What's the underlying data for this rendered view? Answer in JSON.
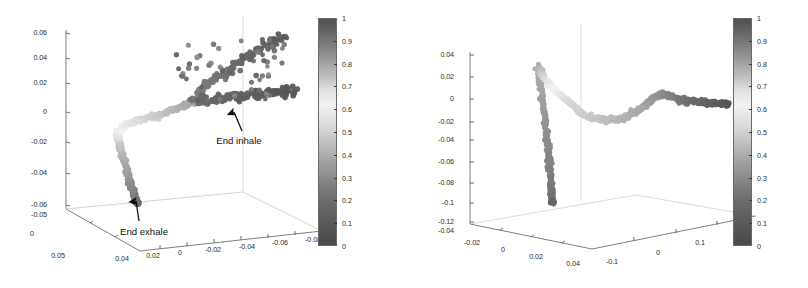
{
  "figure": {
    "background": "#ffffff",
    "panel_count": 2
  },
  "chart_data": [
    {
      "type": "scatter",
      "title": "",
      "subtitle": "",
      "projection": "3d",
      "panel": "left",
      "xlabel": "",
      "ylabel": "",
      "zlabel": "",
      "grid": false,
      "legend": null,
      "colormap": "grayscale-jet",
      "colorbar": {
        "min": 0,
        "max": 1,
        "ticks": [
          "1",
          "0.9",
          "0.8",
          "0.7",
          "0.6",
          "0.5",
          "0.4",
          "0.3",
          "0.2",
          "0.1",
          "0"
        ],
        "orientation": "vertical",
        "position": "right"
      },
      "axes": {
        "vertical_axis_ticks": [
          "0.06",
          "0.04",
          "0.02",
          "0",
          "-0.02",
          "-0.04",
          "-0.06"
        ],
        "vertical_axis_range": [
          -0.06,
          0.06
        ],
        "depth_axis_ticks": [
          "-0.05",
          "0",
          "0.05"
        ],
        "depth_axis_range": [
          -0.05,
          0.05
        ],
        "horizontal_axis_ticks": [
          "0.04",
          "0.02",
          "0",
          "-0.02",
          "-0.04",
          "-0.06",
          "-0.08"
        ],
        "horizontal_axis_range": [
          0.04,
          -0.08
        ]
      },
      "annotations": [
        {
          "text": "End inhale",
          "arrow": "up",
          "target": "upper-right dark cluster"
        },
        {
          "text": "End exhale",
          "arrow": "up",
          "target": "lower-left dark branch"
        }
      ],
      "points": [
        [
          0.163,
          0.131,
          0.93
        ],
        [
          0.176,
          0.138,
          0.93
        ],
        [
          0.169,
          0.15,
          0.92
        ],
        [
          0.182,
          0.147,
          0.92
        ],
        [
          0.195,
          0.16,
          0.91
        ],
        [
          0.189,
          0.172,
          0.9
        ],
        [
          0.203,
          0.168,
          0.9
        ],
        [
          0.211,
          0.18,
          0.89
        ],
        [
          0.206,
          0.192,
          0.88
        ],
        [
          0.219,
          0.188,
          0.88
        ],
        [
          0.228,
          0.2,
          0.87
        ],
        [
          0.222,
          0.212,
          0.86
        ],
        [
          0.235,
          0.208,
          0.86
        ],
        [
          0.243,
          0.22,
          0.85
        ],
        [
          0.238,
          0.232,
          0.84
        ],
        [
          0.251,
          0.228,
          0.84
        ],
        [
          0.259,
          0.24,
          0.83
        ],
        [
          0.253,
          0.252,
          0.82
        ],
        [
          0.266,
          0.248,
          0.82
        ],
        [
          0.274,
          0.26,
          0.81
        ],
        [
          0.269,
          0.272,
          0.8
        ],
        [
          0.282,
          0.268,
          0.8
        ],
        [
          0.29,
          0.281,
          0.79
        ],
        [
          0.285,
          0.292,
          0.78
        ],
        [
          0.298,
          0.29,
          0.78
        ],
        [
          0.306,
          0.302,
          0.77
        ],
        [
          0.3,
          0.313,
          0.76
        ],
        [
          0.314,
          0.31,
          0.76
        ],
        [
          0.322,
          0.323,
          0.75
        ],
        [
          0.316,
          0.334,
          0.74
        ],
        [
          0.33,
          0.331,
          0.73
        ],
        [
          0.337,
          0.343,
          0.72
        ],
        [
          0.332,
          0.355,
          0.71
        ],
        [
          0.345,
          0.352,
          0.7
        ],
        [
          0.353,
          0.364,
          0.69
        ],
        [
          0.348,
          0.375,
          0.68
        ],
        [
          0.361,
          0.373,
          0.67
        ],
        [
          0.369,
          0.384,
          0.66
        ],
        [
          0.363,
          0.396,
          0.65
        ],
        [
          0.377,
          0.393,
          0.64
        ],
        [
          0.385,
          0.404,
          0.63
        ],
        [
          0.38,
          0.416,
          0.62
        ],
        [
          0.393,
          0.413,
          0.61
        ],
        [
          0.401,
          0.424,
          0.6
        ],
        [
          0.396,
          0.436,
          0.59
        ],
        [
          0.409,
          0.433,
          0.58
        ],
        [
          0.417,
          0.444,
          0.57
        ],
        [
          0.412,
          0.456,
          0.56
        ],
        [
          0.425,
          0.452,
          0.55
        ],
        [
          0.433,
          0.462,
          0.54
        ],
        [
          0.429,
          0.472,
          0.53
        ],
        [
          0.441,
          0.468,
          0.52
        ],
        [
          0.449,
          0.478,
          0.51
        ],
        [
          0.445,
          0.487,
          0.5
        ],
        [
          0.457,
          0.483,
          0.49
        ],
        [
          0.464,
          0.492,
          0.48
        ],
        [
          0.46,
          0.5,
          0.47
        ],
        [
          0.472,
          0.496,
          0.46
        ],
        [
          0.479,
          0.504,
          0.45
        ],
        [
          0.475,
          0.512,
          0.44
        ],
        [
          0.487,
          0.508,
          0.43
        ],
        [
          0.494,
          0.516,
          0.42
        ],
        [
          0.49,
          0.524,
          0.41
        ],
        [
          0.502,
          0.52,
          0.4
        ],
        [
          0.509,
          0.527,
          0.39
        ],
        [
          0.505,
          0.534,
          0.38
        ],
        [
          0.517,
          0.53,
          0.37
        ],
        [
          0.524,
          0.537,
          0.36
        ],
        [
          0.52,
          0.544,
          0.35
        ],
        [
          0.532,
          0.54,
          0.34
        ],
        [
          0.539,
          0.547,
          0.33
        ],
        [
          0.535,
          0.554,
          0.32
        ],
        [
          0.547,
          0.55,
          0.31
        ],
        [
          0.554,
          0.556,
          0.3
        ],
        [
          0.55,
          0.562,
          0.3
        ],
        [
          0.562,
          0.558,
          0.29
        ],
        [
          0.569,
          0.564,
          0.28
        ],
        [
          0.565,
          0.57,
          0.28
        ],
        [
          0.577,
          0.566,
          0.27
        ],
        [
          0.584,
          0.572,
          0.26
        ],
        [
          0.58,
          0.578,
          0.26
        ],
        [
          0.592,
          0.574,
          0.25
        ],
        [
          0.599,
          0.58,
          0.25
        ],
        [
          0.595,
          0.586,
          0.24
        ],
        [
          0.607,
          0.582,
          0.24
        ],
        [
          0.614,
          0.588,
          0.23
        ],
        [
          0.61,
          0.594,
          0.23
        ],
        [
          0.622,
          0.59,
          0.22
        ],
        [
          0.629,
          0.596,
          0.22
        ],
        [
          0.625,
          0.602,
          0.21
        ],
        [
          0.637,
          0.598,
          0.21
        ],
        [
          0.644,
          0.604,
          0.2
        ],
        [
          0.64,
          0.61,
          0.2
        ],
        [
          0.652,
          0.606,
          0.19
        ],
        [
          0.659,
          0.612,
          0.19
        ],
        [
          0.655,
          0.618,
          0.18
        ],
        [
          0.667,
          0.614,
          0.18
        ],
        [
          0.674,
          0.62,
          0.17
        ],
        [
          0.67,
          0.626,
          0.17
        ],
        [
          0.682,
          0.622,
          0.16
        ],
        [
          0.689,
          0.628,
          0.16
        ],
        [
          0.685,
          0.634,
          0.15
        ],
        [
          0.697,
          0.63,
          0.15
        ],
        [
          0.704,
          0.636,
          0.14
        ],
        [
          0.7,
          0.642,
          0.14
        ],
        [
          0.712,
          0.638,
          0.13
        ],
        [
          0.719,
          0.644,
          0.13
        ],
        [
          0.715,
          0.65,
          0.12
        ],
        [
          0.727,
          0.646,
          0.12
        ],
        [
          0.734,
          0.652,
          0.11
        ],
        [
          0.73,
          0.658,
          0.11
        ],
        [
          0.742,
          0.654,
          0.1
        ],
        [
          0.749,
          0.66,
          0.1
        ],
        [
          0.745,
          0.666,
          0.09
        ],
        [
          0.757,
          0.662,
          0.09
        ],
        [
          0.764,
          0.668,
          0.08
        ]
      ]
    },
    {
      "type": "scatter",
      "title": "",
      "subtitle": "",
      "projection": "3d",
      "panel": "right",
      "xlabel": "",
      "ylabel": "",
      "zlabel": "",
      "grid": false,
      "legend": null,
      "colormap": "grayscale-jet",
      "colorbar": {
        "min": 0,
        "max": 1,
        "ticks": [
          "1",
          "0.9",
          "0.8",
          "0.7",
          "0.6",
          "0.5",
          "0.4",
          "0.3",
          "0.2",
          "0.1",
          "0"
        ],
        "orientation": "vertical",
        "position": "right"
      },
      "axes": {
        "vertical_axis_ticks": [
          "0.04",
          "0.02",
          "0",
          "-0.02",
          "-0.04",
          "-0.06",
          "-0.08",
          "-0.1",
          "-0.12"
        ],
        "vertical_axis_range": [
          -0.12,
          0.04
        ],
        "depth_axis_ticks": [
          "-0.04",
          "-0.02",
          "0",
          "0.02",
          "0.04"
        ],
        "depth_axis_range": [
          -0.04,
          0.04
        ],
        "horizontal_axis_ticks": [
          "-0.1",
          "0",
          "0.1",
          "0.2"
        ],
        "horizontal_axis_range": [
          -0.1,
          0.2
        ]
      },
      "annotations": [],
      "points": []
    }
  ],
  "panels": {
    "left": {
      "name": "left-3d-scatter-panel",
      "ticklabels_y": [
        {
          "t": "0.06",
          "x": 47,
          "y": 33
        },
        {
          "t": "0.04",
          "x": 47,
          "y": 58
        },
        {
          "t": "0.02",
          "x": 47,
          "y": 83
        },
        {
          "t": "0",
          "x": 47,
          "y": 112
        },
        {
          "t": "-0.02",
          "x": 47,
          "y": 142
        },
        {
          "t": "-0.04",
          "x": 47,
          "y": 173
        },
        {
          "t": "-0.06",
          "x": 47,
          "y": 205
        }
      ],
      "ticklabels_depth": [
        {
          "t": "-0.05",
          "x": 47,
          "y": 215
        },
        {
          "t": "0",
          "x": 32,
          "y": 234
        },
        {
          "t": "0.05",
          "x": 58,
          "y": 256
        }
      ],
      "ticklabels_x": [
        {
          "t": "0.04",
          "x": 122,
          "y": 259
        },
        {
          "t": "0.02",
          "x": 153,
          "y": 256
        },
        {
          "t": "0",
          "x": 180,
          "y": 253
        },
        {
          "t": "-0.02",
          "x": 213,
          "y": 250
        },
        {
          "t": "-0.04",
          "x": 247,
          "y": 247
        },
        {
          "t": "-0.06",
          "x": 280,
          "y": 243
        },
        {
          "t": "-0.08",
          "x": 313,
          "y": 240
        }
      ],
      "annotations": [
        {
          "t": "End inhale",
          "x": 239,
          "y": 140
        },
        {
          "t": "End exhale",
          "x": 144,
          "y": 231
        }
      ]
    },
    "right": {
      "name": "right-3d-scatter-panel",
      "ticklabels_y": [
        {
          "t": "0.04",
          "x": 50,
          "y": 55
        },
        {
          "t": "0.02",
          "x": 50,
          "y": 77
        },
        {
          "t": "0",
          "x": 50,
          "y": 99
        },
        {
          "t": "-0.02",
          "x": 50,
          "y": 122
        },
        {
          "t": "-0.04",
          "x": 50,
          "y": 140
        },
        {
          "t": "-0.06",
          "x": 50,
          "y": 162
        },
        {
          "t": "-0.08",
          "x": 50,
          "y": 183
        },
        {
          "t": "-0.1",
          "x": 50,
          "y": 203
        },
        {
          "t": "-0.12",
          "x": 50,
          "y": 222
        }
      ],
      "ticklabels_depth": [
        {
          "t": "-0.04",
          "x": 50,
          "y": 231
        },
        {
          "t": "-0.02",
          "x": 68,
          "y": 243
        },
        {
          "t": "0",
          "x": 99,
          "y": 250
        },
        {
          "t": "0.02",
          "x": 132,
          "y": 257
        },
        {
          "t": "0.04",
          "x": 169,
          "y": 264
        }
      ],
      "ticklabels_x": [
        {
          "t": "-0.1",
          "x": 208,
          "y": 262
        },
        {
          "t": "0",
          "x": 254,
          "y": 253
        },
        {
          "t": "0.1",
          "x": 296,
          "y": 243
        },
        {
          "t": "0.2",
          "x": 340,
          "y": 233
        }
      ]
    }
  },
  "colorbars": {
    "left": {
      "name": "left-colorbar",
      "x": 318,
      "y": 18,
      "w": 19,
      "h": 228,
      "ticks": [
        "1",
        "0.9",
        "0.8",
        "0.7",
        "0.6",
        "0.5",
        "0.4",
        "0.3",
        "0.2",
        "0.1",
        "0"
      ]
    },
    "right": {
      "name": "right-colorbar",
      "x": 733,
      "y": 18,
      "w": 19,
      "h": 228,
      "ticks": [
        "1",
        "0.9",
        "0.8",
        "0.7",
        "0.6",
        "0.5",
        "0.4",
        "0.3",
        "0.2",
        "0.1",
        "0"
      ]
    }
  }
}
